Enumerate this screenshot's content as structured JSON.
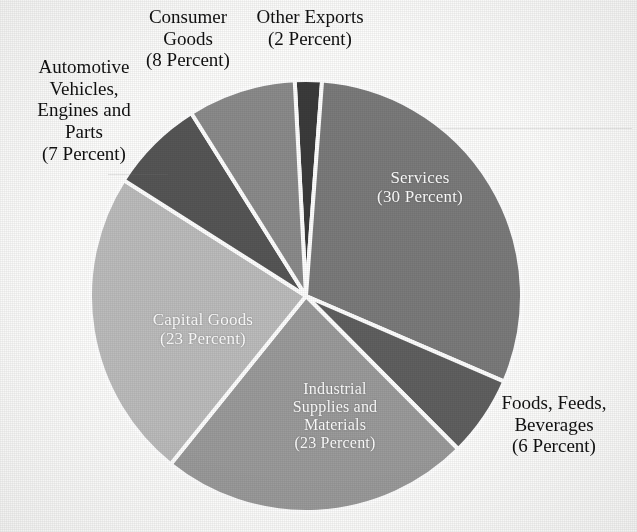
{
  "figure": {
    "background_color": "#fdfdfc",
    "outside_label_color": "#111111",
    "inside_label_color": "#ffffff",
    "separator_color": "#ffffff"
  },
  "chart_data": {
    "type": "pie",
    "title": "",
    "subtitle": "",
    "xlabel": "",
    "ylabel": "",
    "grid": false,
    "legend": "none",
    "unit": "percent",
    "total": 99,
    "start_angle_deg": -3,
    "direction": "clockwise",
    "center": {
      "x": 306,
      "y": 296
    },
    "radius": 216,
    "categories": [
      "Other Exports",
      "Services",
      "Foods, Feeds, Beverages",
      "Industrial Supplies and Materials",
      "Capital Goods",
      "Automotive Vehicles, Engines and Parts",
      "Consumer Goods"
    ],
    "values": [
      2,
      30,
      6,
      23,
      23,
      7,
      8
    ],
    "slices": [
      {
        "name": "Other Exports",
        "value": 2,
        "value_text": "(2 Percent)",
        "color": "#3b3b3b",
        "label_lines": [
          "Other Exports",
          "(2 Percent)"
        ],
        "label_placement": "outside"
      },
      {
        "name": "Services",
        "value": 30,
        "value_text": "(30 Percent)",
        "color": "#7b7b7b",
        "label_lines": [
          "Services",
          "(30 Percent)"
        ],
        "label_placement": "inside"
      },
      {
        "name": "Foods, Feeds, Beverages",
        "value": 6,
        "value_text": "(6 Percent)",
        "color": "#606060",
        "label_lines": [
          "Foods, Feeds,",
          "Beverages",
          "(6 Percent)"
        ],
        "label_placement": "outside"
      },
      {
        "name": "Industrial Supplies and Materials",
        "value": 23,
        "value_text": "(23 Percent)",
        "color": "#9b9b9b",
        "label_lines": [
          "Industrial",
          "Supplies and",
          "Materials",
          "(23 Percent)"
        ],
        "label_placement": "inside"
      },
      {
        "name": "Capital Goods",
        "value": 23,
        "value_text": "(23 Percent)",
        "color": "#bcbcbc",
        "label_lines": [
          "Capital Goods",
          "(23 Percent)"
        ],
        "label_placement": "inside"
      },
      {
        "name": "Automotive Vehicles, Engines and Parts",
        "value": 7,
        "value_text": "(7 Percent)",
        "color": "#565656",
        "label_lines": [
          "Automotive",
          "Vehicles,",
          "Engines and",
          "Parts",
          "(7 Percent)"
        ],
        "label_placement": "outside"
      },
      {
        "name": "Consumer Goods",
        "value": 8,
        "value_text": "(8 Percent)",
        "color": "#8b8b8b",
        "label_lines": [
          "Consumer",
          "Goods",
          "(8 Percent)"
        ],
        "label_placement": "outside"
      }
    ]
  },
  "labels": {
    "consumer_goods": {
      "l1": "Consumer",
      "l2": "Goods",
      "l3": "(8 Percent)"
    },
    "other_exports": {
      "l1": "Other Exports",
      "l2": "(2 Percent)"
    },
    "automotive": {
      "l1": "Automotive",
      "l2": "Vehicles,",
      "l3": "Engines and",
      "l4": "Parts",
      "l5": "(7 Percent)"
    },
    "services": {
      "l1": "Services",
      "l2": "(30 Percent)"
    },
    "capital_goods": {
      "l1": "Capital Goods",
      "l2": "(23 Percent)"
    },
    "industrial": {
      "l1": "Industrial",
      "l2": "Supplies and",
      "l3": "Materials",
      "l4": "(23 Percent)"
    },
    "foods": {
      "l1": "Foods, Feeds,",
      "l2": "Beverages",
      "l3": "(6 Percent)"
    }
  }
}
